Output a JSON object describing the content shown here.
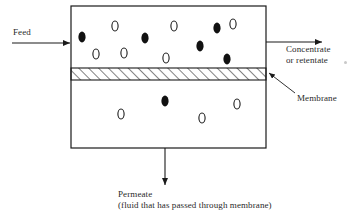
{
  "diagram": {
    "labels": {
      "feed": "Feed",
      "concentrate_line1": "Concentrate",
      "concentrate_line2": "or retentate",
      "membrane": "Membrane",
      "permeate_line1": "Permeate",
      "permeate_line2": "(fluid that has passed through membrane)"
    },
    "colors": {
      "stroke": "#1a1a1a",
      "solute_fill": "#111111",
      "solvent_fill": "#ffffff",
      "background": "#ffffff",
      "hatch": "#1a1a1a"
    },
    "module_box": {
      "x": 71,
      "y": 6,
      "width": 195,
      "height": 142
    },
    "membrane_band": {
      "x": 71,
      "y": 68,
      "width": 195,
      "height": 12,
      "hatch_angle_deg": 45
    },
    "arrows": {
      "feed": {
        "x1": 12,
        "y1": 43,
        "x2": 71,
        "y2": 43,
        "direction": "right"
      },
      "concentrate": {
        "x1": 266,
        "y1": 42,
        "x2": 322,
        "y2": 42,
        "direction": "right"
      },
      "permeate": {
        "x1": 165,
        "y1": 148,
        "x2": 165,
        "y2": 185,
        "direction": "down"
      },
      "membrane_leader": {
        "x1": 295,
        "y1": 93,
        "x2": 268,
        "y2": 72,
        "direction": "up-left"
      }
    },
    "upper_chamber": {
      "name": "feed-retentate-chamber",
      "solute_particles": [
        {
          "cx": 82,
          "cy": 37
        },
        {
          "cx": 145,
          "cy": 38
        },
        {
          "cx": 217,
          "cy": 28
        },
        {
          "cx": 200,
          "cy": 46
        },
        {
          "cx": 227,
          "cy": 59
        }
      ],
      "solvent_particles": [
        {
          "cx": 115,
          "cy": 26
        },
        {
          "cx": 174,
          "cy": 26
        },
        {
          "cx": 233,
          "cy": 24
        },
        {
          "cx": 96,
          "cy": 54
        },
        {
          "cx": 124,
          "cy": 53
        },
        {
          "cx": 166,
          "cy": 58
        }
      ]
    },
    "lower_chamber": {
      "name": "permeate-chamber",
      "solute_particles": [
        {
          "cx": 165,
          "cy": 101
        }
      ],
      "solvent_particles": [
        {
          "cx": 121,
          "cy": 114
        },
        {
          "cx": 202,
          "cy": 118
        },
        {
          "cx": 237,
          "cy": 104
        }
      ]
    },
    "artifact_speck": {
      "x": 344,
      "y": 61
    }
  }
}
